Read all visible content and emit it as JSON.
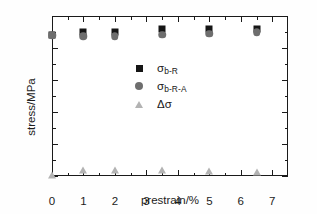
{
  "chart_data": {
    "type": "scatter",
    "title": "",
    "xlabel": "prestrain/%",
    "ylabel": "stress/MPa",
    "xlim": [
      0,
      7.5
    ],
    "ylim": [
      0,
      500
    ],
    "xticks": [
      0,
      1,
      2,
      3,
      4,
      5,
      6,
      7
    ],
    "yticks": [
      0,
      100,
      200,
      300,
      400,
      500
    ],
    "xtick_labels": [
      "0",
      "1",
      "2",
      "3",
      "4",
      "5",
      "6",
      "7"
    ],
    "ytick_labels": [
      "0",
      "100",
      "200",
      "300",
      "400",
      "500"
    ],
    "grid": false,
    "legend_position": "upper-left-inside",
    "x": [
      0,
      1,
      2,
      3.5,
      5,
      6.5
    ],
    "series": [
      {
        "name": "σb-R",
        "label_main": "σ",
        "label_sub": "b-R",
        "marker": "square",
        "color": "#151515",
        "values": [
          440,
          450,
          450,
          458,
          458,
          458
        ]
      },
      {
        "name": "σb-R-A",
        "label_main": "σ",
        "label_sub": "b-R-A",
        "marker": "circle",
        "color": "#6e6e6e",
        "values": [
          440,
          437,
          437,
          442,
          445,
          450
        ]
      },
      {
        "name": "Δσ",
        "label_main": "Δσ",
        "label_sub": "",
        "marker": "triangle",
        "color": "#b3b3b3",
        "values": [
          3,
          18,
          18,
          20,
          17,
          12
        ]
      }
    ]
  },
  "axis": {
    "frame_color": "#1a1a1a"
  }
}
